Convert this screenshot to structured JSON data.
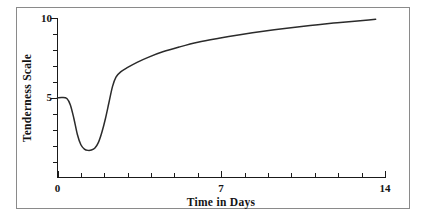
{
  "figure": {
    "background_color": "#ffffff",
    "frame_color": "#8a8a8a",
    "has_outer_border": true
  },
  "chart_data": {
    "type": "line",
    "title": "",
    "subtitle": "",
    "xlabel": "Time in Days",
    "ylabel": "Tenderness Scale",
    "xlim": [
      0,
      14
    ],
    "ylim": [
      0,
      10
    ],
    "grid": false,
    "legend": null,
    "legend_position": "none",
    "line_color": "#2b2b2b",
    "x_tick_labels": [
      "0",
      "7",
      "14"
    ],
    "x_tick_label_values": [
      0,
      7,
      14
    ],
    "x_minor_ticks": [
      0,
      1,
      2,
      3,
      4,
      5,
      6,
      7,
      8,
      9,
      10,
      11,
      12,
      13,
      14
    ],
    "y_tick_labels": [
      "5",
      "10"
    ],
    "y_tick_label_values": [
      5,
      10
    ],
    "y_minor_ticks": [
      1,
      2,
      3,
      4,
      5,
      6,
      7,
      8,
      9,
      10
    ],
    "series": [
      {
        "name": "Tenderness",
        "x": [
          0.0,
          0.2,
          0.4,
          0.55,
          0.7,
          0.85,
          1.0,
          1.15,
          1.3,
          1.45,
          1.6,
          1.75,
          1.9,
          2.05,
          2.2,
          2.35,
          2.5,
          2.7,
          3.0,
          3.4,
          3.9,
          4.5,
          5.2,
          6.0,
          6.9,
          7.8,
          8.8,
          9.8,
          10.8,
          11.8,
          12.7,
          13.3,
          13.6
        ],
        "y": [
          5.0,
          5.02,
          4.95,
          4.55,
          3.7,
          2.7,
          2.05,
          1.78,
          1.7,
          1.72,
          1.85,
          2.2,
          2.85,
          3.7,
          4.7,
          5.7,
          6.3,
          6.62,
          6.9,
          7.22,
          7.55,
          7.88,
          8.18,
          8.48,
          8.73,
          8.95,
          9.17,
          9.36,
          9.53,
          9.68,
          9.8,
          9.88,
          9.92
        ]
      }
    ],
    "annotations": [
      {
        "label": "initial plateau",
        "x": 0.2,
        "y": 5.0
      },
      {
        "label": "rigor minimum",
        "x": 1.3,
        "y": 1.7
      },
      {
        "label": "post-rigor knee",
        "x": 2.5,
        "y": 6.3
      },
      {
        "label": "asymptotic endpoint",
        "x": 13.6,
        "y": 9.92
      }
    ]
  }
}
